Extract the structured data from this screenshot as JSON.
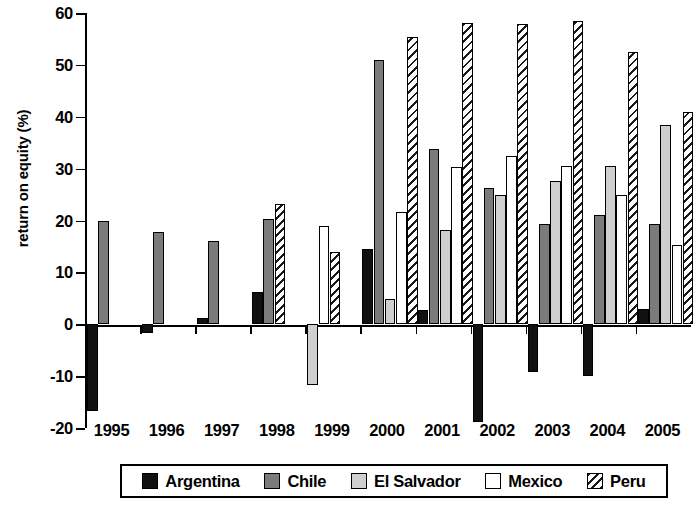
{
  "chart_data": {
    "type": "bar",
    "title": "",
    "subtitle": "",
    "xlabel": "",
    "ylabel": "return on equity (%)",
    "categories": [
      "1995",
      "1996",
      "1997",
      "1998",
      "1999",
      "2000",
      "2001",
      "2002",
      "2003",
      "2004",
      "2005"
    ],
    "ylim": [
      -20,
      60
    ],
    "ytick_labels": [
      "60",
      "50",
      "40",
      "30",
      "20",
      "10",
      "0",
      "-10",
      "-20"
    ],
    "ytick_values": [
      60,
      50,
      40,
      30,
      20,
      10,
      0,
      -10,
      -20
    ],
    "grid": false,
    "legend_position": "bottom",
    "series": [
      {
        "name": "Argentina",
        "color": "#111111",
        "pattern": "solid",
        "values": [
          -16.8,
          -1.6,
          1.2,
          6.2,
          null,
          14.5,
          2.7,
          -18.8,
          -9.2,
          -10.0,
          3.0
        ]
      },
      {
        "name": "Chile",
        "color": "#7b7b7b",
        "pattern": "solid",
        "values": [
          20.0,
          17.7,
          16.1,
          20.2,
          null,
          50.9,
          33.8,
          26.3,
          19.4,
          21.0,
          19.3
        ]
      },
      {
        "name": "El Salvador",
        "color": "#cfcfcf",
        "pattern": "solid",
        "values": [
          null,
          null,
          null,
          null,
          -11.7,
          4.9,
          18.1,
          25.0,
          27.6,
          30.6,
          38.5
        ]
      },
      {
        "name": "Mexico",
        "color": "#ffffff",
        "pattern": "solid",
        "values": [
          null,
          null,
          null,
          null,
          19.0,
          21.6,
          30.4,
          32.5,
          30.6,
          25.0,
          15.3
        ]
      },
      {
        "name": "Peru",
        "color": "#ffffff",
        "pattern": "diagonal-hatch",
        "values": [
          null,
          null,
          null,
          23.2,
          14.0,
          55.4,
          58.1,
          57.8,
          58.4,
          52.4,
          41.0
        ]
      }
    ]
  },
  "legend": {
    "items": [
      {
        "label": "Argentina",
        "swatch": "s-argentina"
      },
      {
        "label": "Chile",
        "swatch": "s-chile"
      },
      {
        "label": "El Salvador",
        "swatch": "s-elsalvador"
      },
      {
        "label": "Mexico",
        "swatch": "s-mexico"
      },
      {
        "label": "Peru",
        "swatch": "s-peru"
      }
    ]
  }
}
